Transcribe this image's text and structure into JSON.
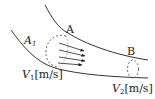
{
  "diagram": {
    "type": "fluid-flow-pipe",
    "labels": {
      "section_a": "A",
      "area_a1": "A",
      "area_a1_sub": "1",
      "velocity_1": "V",
      "velocity_1_sub": "1",
      "velocity_1_unit": "[m/s]",
      "section_b": "B",
      "velocity_2": "V",
      "velocity_2_sub": "2",
      "velocity_2_unit": "[m/s]"
    },
    "colors": {
      "line": "#333333",
      "background": "#ffffff"
    },
    "flow_arrows": 4
  }
}
